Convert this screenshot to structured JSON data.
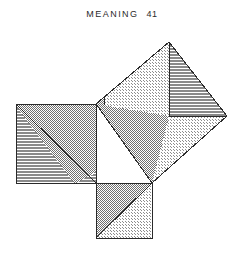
{
  "page": {
    "running_head": "MEANING",
    "page_number": "41",
    "background_color": "#ffffff",
    "ink_color": "#1a1a1a"
  },
  "figure": {
    "name": "pythagorean-theorem-dissection",
    "stroke_color": "#2a2a2a",
    "stroke_width": 1,
    "fills": {
      "white": "#ffffff",
      "light_dot": "#d8d8d8",
      "mid_check": "#9a9a9a",
      "dark_check": "#8f8f8f",
      "line_hatch": "#bdbdbd"
    },
    "points": {
      "triangle_right_angle": [
        96,
        104
      ],
      "triangle_bottom_left": [
        96,
        183
      ],
      "triangle_bottom_right": [
        152,
        183
      ],
      "leg_square_left_tl": [
        16,
        104
      ],
      "leg_square_left_bl": [
        16,
        183
      ],
      "leg_square_bottom_bl": [
        96,
        238
      ],
      "leg_square_bottom_br": [
        152,
        238
      ],
      "hyp_square_top": [
        169,
        42
      ],
      "hyp_square_right": [
        227,
        116
      ],
      "hyp_square_mid_v": [
        169,
        116
      ],
      "notch_inner": [
        104,
        96
      ]
    },
    "regions": [
      {
        "name": "left-square-lower-hatch",
        "fill": "line_hatch"
      },
      {
        "name": "left-square-upper-check",
        "fill": "mid_check"
      },
      {
        "name": "left-square-corner-hatch",
        "fill": "line_hatch"
      },
      {
        "name": "central-right-triangle",
        "fill": "white"
      },
      {
        "name": "central-dark-triangle",
        "fill": "mid_check"
      },
      {
        "name": "bottom-square-upper-check",
        "fill": "mid_check"
      },
      {
        "name": "bottom-square-lower-dot",
        "fill": "light_dot"
      },
      {
        "name": "hyp-square-upper-left-dot",
        "fill": "light_dot"
      },
      {
        "name": "hyp-square-upper-right-hatch",
        "fill": "line_hatch"
      },
      {
        "name": "hyp-square-lower-left-check",
        "fill": "mid_check"
      },
      {
        "name": "hyp-square-lower-right-dot",
        "fill": "light_dot"
      },
      {
        "name": "hyp-square-notch-check",
        "fill": "mid_check"
      }
    ]
  }
}
